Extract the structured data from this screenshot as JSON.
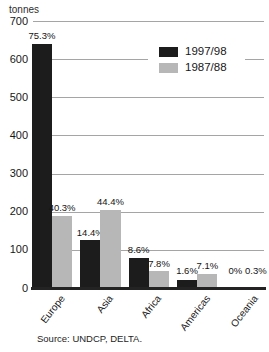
{
  "chart_data": {
    "type": "bar",
    "title": "",
    "ylabel": "tonnes",
    "xlabel": "",
    "categories": [
      "Europe",
      "Asia",
      "Africa",
      "Americas",
      "Oceania"
    ],
    "series": [
      {
        "name": "1997/98",
        "color": "#1c1c1c",
        "values": [
          640,
          125,
          80,
          22,
          0
        ],
        "labels": [
          "75.3%",
          "14.4%",
          "8.6%",
          "1.6%",
          "0%"
        ]
      },
      {
        "name": "1987/88",
        "color": "#b7b7b7",
        "values": [
          190,
          205,
          44,
          38,
          2
        ],
        "labels": [
          "40.3%",
          "44.4%",
          "7.8%",
          "7.1%",
          "0.3%"
        ]
      }
    ],
    "ylim": [
      0,
      700
    ],
    "yticks": [
      0,
      100,
      200,
      300,
      400,
      500,
      600,
      700
    ],
    "grid": true,
    "legend_position": "upper center-right"
  },
  "source": "Source: UNDCP, DELTA."
}
